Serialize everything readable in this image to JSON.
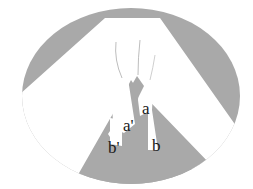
{
  "figure": {
    "type": "schematic-diagram",
    "colors": {
      "background": "#ffffff",
      "shaded": "#a9a9a9",
      "unshaded": "#ffffff",
      "text": "#1a1a1a"
    },
    "labels": [
      {
        "id": "a",
        "text": "a",
        "x": 142,
        "y": 114
      },
      {
        "id": "a-prime",
        "text": "a'",
        "x": 123,
        "y": 131
      },
      {
        "id": "b-prime",
        "text": "b'",
        "x": 108,
        "y": 153
      },
      {
        "id": "b",
        "text": "b",
        "x": 152,
        "y": 151
      }
    ]
  }
}
